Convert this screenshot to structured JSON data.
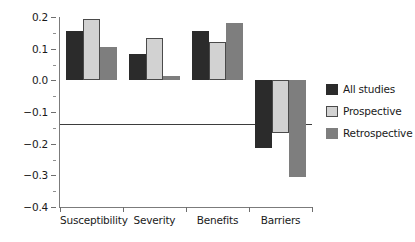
{
  "chart_data": {
    "type": "bar",
    "title": "",
    "xlabel": "",
    "ylabel": "Effect size (r)",
    "categories": [
      "Susceptibility",
      "Severity",
      "Benefits",
      "Barriers"
    ],
    "series": [
      {
        "name": "All studies",
        "color": "#2b2b2b",
        "values": [
          0.155,
          0.082,
          0.155,
          -0.215
        ]
      },
      {
        "name": "Prospective",
        "color": "#d2d2d2",
        "values": [
          0.195,
          0.133,
          0.12,
          -0.165
        ]
      },
      {
        "name": "Retrospective",
        "color": "#7e7e7e",
        "values": [
          0.104,
          0.014,
          0.18,
          -0.305
        ]
      }
    ],
    "ylim": [
      -0.4,
      0.2
    ],
    "ytick_labels": [
      "0.2",
      "0.1",
      "0.0",
      "−0.1",
      "−0.2",
      "−0.3",
      "−0.4"
    ],
    "ytick_values": [
      0.2,
      0.1,
      0.0,
      -0.1,
      -0.2,
      -0.3,
      -0.4
    ],
    "yminor_values": [
      0.15,
      0.05,
      -0.05,
      -0.15,
      -0.25,
      -0.35
    ],
    "grid": false,
    "legend_position": "right"
  },
  "legend": {
    "items": [
      {
        "label": "All studies",
        "swatch": "dark"
      },
      {
        "label": "Prospective",
        "swatch": "light"
      },
      {
        "label": "Retrospective",
        "swatch": "medium"
      }
    ]
  },
  "axis": {
    "y_label_prefix": "Effect size (",
    "y_label_italic": "r",
    "y_label_suffix": ")"
  }
}
